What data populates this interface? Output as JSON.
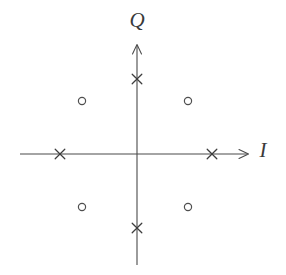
{
  "figure": {
    "type": "constellation-diagram",
    "title": "",
    "background_color": "#ffffff",
    "width": 286,
    "height": 275
  },
  "axes": {
    "horizontal": {
      "label": "I",
      "label_name": "in-phase-axis-label",
      "arrow_direction": "right",
      "color": "#4a4a4a"
    },
    "vertical": {
      "label": "Q",
      "label_name": "quadrature-axis-label",
      "arrow_direction": "up",
      "color": "#4a4a4a"
    },
    "origin": {
      "x": 137,
      "y": 154
    }
  },
  "chart_data": {
    "type": "scatter",
    "title": "",
    "xlabel": "I",
    "ylabel": "Q",
    "xlim": [
      -1.55,
      1.55
    ],
    "ylim": [
      -1.55,
      1.55
    ],
    "grid": false,
    "legend": "none",
    "series": [
      {
        "name": "cross-points",
        "marker": "x",
        "color": "#3d3d3d",
        "points": [
          {
            "x": 1.0,
            "y": 0.0,
            "px": 212,
            "py": 154
          },
          {
            "x": 0.0,
            "y": 1.0,
            "px": 137,
            "py": 79
          },
          {
            "x": -1.0,
            "y": 0.0,
            "px": 60,
            "py": 154
          },
          {
            "x": 0.0,
            "y": -1.0,
            "px": 137,
            "py": 228
          }
        ]
      },
      {
        "name": "circle-points",
        "marker": "o",
        "color": "#4f4f4f",
        "points": [
          {
            "x": 0.68,
            "y": 0.71,
            "px": 188,
            "py": 101
          },
          {
            "x": -0.73,
            "y": 0.71,
            "px": 82,
            "py": 101
          },
          {
            "x": -0.73,
            "y": -0.71,
            "px": 82,
            "py": 207
          },
          {
            "x": 0.68,
            "y": -0.71,
            "px": 188,
            "py": 207
          }
        ]
      }
    ]
  }
}
